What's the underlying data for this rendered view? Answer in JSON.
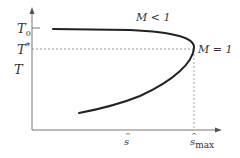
{
  "diagram": {
    "type": "T-s curve (Fanno-type)",
    "y_axis_labels": {
      "T0": "T",
      "T0_sub": "0",
      "Tstar": "T",
      "Tstar_sup": "*",
      "T": "T"
    },
    "x_axis_labels": {
      "s_hat": "s",
      "s_hat_max": "s",
      "s_hat_max_sub": "max",
      "hat": "^"
    },
    "annotations": {
      "subsonic": "M < 1",
      "choked": "M = 1"
    },
    "colors": {
      "curve": "#222222",
      "axis": "#777777",
      "dashed": "#888888",
      "text": "#333333"
    }
  }
}
